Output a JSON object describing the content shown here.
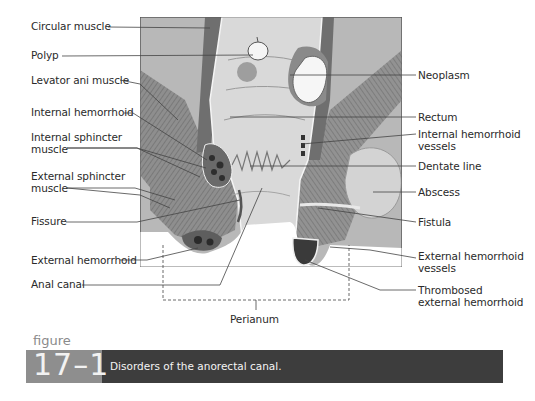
{
  "figure": {
    "word": "figure",
    "number": "17–1",
    "caption": "Disorders of the anorectal canal."
  },
  "labels_left": {
    "circular_muscle": "Circular muscle",
    "polyp": "Polyp",
    "levator_ani": "Levator ani muscle",
    "internal_hemorrhoid": "Internal hemorrhoid",
    "internal_sphincter_1": "Internal sphincter",
    "internal_sphincter_2": "muscle",
    "external_sphincter_1": "External sphincter",
    "external_sphincter_2": "muscle",
    "fissure": "Fissure",
    "external_hemorrhoid": "External hemorrhoid",
    "anal_canal": "Anal canal"
  },
  "labels_right": {
    "neoplasm": "Neoplasm",
    "rectum": "Rectum",
    "internal_hemorrhoid_vessels_1": "Internal hemorrhoid",
    "internal_hemorrhoid_vessels_2": "vessels",
    "dentate_line": "Dentate line",
    "abscess": "Abscess",
    "fistula": "Fistula",
    "external_hemorrhoid_vessels_1": "External hemorrhoid",
    "external_hemorrhoid_vessels_2": "vessels",
    "thrombosed_1": "Thrombosed",
    "thrombosed_2": "external hemorrhoid"
  },
  "labels_bottom": {
    "perianum": "Perianum"
  },
  "colors": {
    "background_tissue": "#b4b4b4",
    "muscle_dark": "#7a7a7a",
    "lumen": "#d8d8d8",
    "neoplasm": "#f6f6f6",
    "caption_dark": "#3d3d3d",
    "caption_gray": "#8e8e8e"
  }
}
